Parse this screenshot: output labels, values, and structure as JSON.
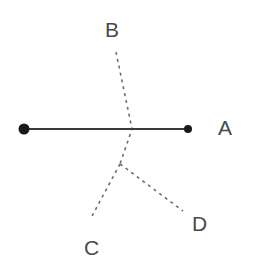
{
  "figure": {
    "background_color": "#ffffff",
    "width": 264,
    "height": 277,
    "solid_line_color": "#3a3a3a",
    "dashed_line_color": "#6e6e6e",
    "label_color": "#4a4a4a",
    "endpoint_dot_color": "#1a1a1a"
  },
  "labels": {
    "a": "A",
    "b": "B",
    "c": "C",
    "d": "D"
  },
  "geometry": {
    "solid_segment": {
      "name": "segment-A",
      "x1": 24,
      "y1": 129,
      "x2": 188,
      "y2": 129,
      "stroke_width": 2,
      "endpoints": [
        {
          "name": "left-endpoint-dot",
          "cx": 24,
          "cy": 129,
          "r": 5.5
        },
        {
          "name": "right-endpoint-dot",
          "cx": 188,
          "cy": 129,
          "r": 4.0
        }
      ]
    },
    "dashed_rays": [
      {
        "name": "ray-B",
        "points": "116,52 132,129 120,164",
        "stroke_width": 1.6,
        "dash": "3 4"
      },
      {
        "name": "ray-C",
        "points": "120,164 91,218",
        "stroke_width": 1.6,
        "dash": "3 4"
      },
      {
        "name": "ray-D",
        "points": "120,164 183,211",
        "stroke_width": 1.6,
        "dash": "3 4"
      }
    ],
    "vertex": {
      "name": "branch-vertex",
      "x": 120,
      "y": 164
    },
    "crossing": {
      "name": "line-crossing-point",
      "x": 132,
      "y": 129
    }
  }
}
